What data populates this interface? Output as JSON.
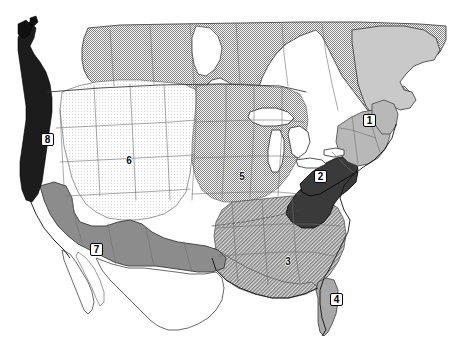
{
  "figure": {
    "width": 458,
    "height": 356,
    "background_color": "#ffffff"
  },
  "map": {
    "projection_note": "North America - continental United States, southern Canada, northern Mexico",
    "outline_color": "#1a1a1a",
    "border_color": "#555555",
    "regions": [
      {
        "id": "region-1",
        "number": "1",
        "area_name": "northeast-new-england",
        "fill_color": "#b8b8b8",
        "pattern": "solid-gray",
        "label_style": "boxed",
        "label_x": 363,
        "label_y": 114
      },
      {
        "id": "region-2",
        "number": "2",
        "area_name": "appalachian-mid-atlantic",
        "fill_color": "#3a3a3a",
        "pattern": "solid-dark",
        "label_style": "boxed",
        "label_x": 314,
        "label_y": 170
      },
      {
        "id": "region-3",
        "number": "3",
        "area_name": "southeast",
        "fill_color": "#c6c6c6",
        "pattern": "diagonal-hatch-light",
        "label_style": "plain",
        "label_x": 282,
        "label_y": 256
      },
      {
        "id": "region-4",
        "number": "4",
        "area_name": "florida-peninsula",
        "fill_color": "#a8a8a8",
        "pattern": "solid-gray",
        "label_style": "boxed",
        "label_x": 330,
        "label_y": 293
      },
      {
        "id": "region-5",
        "number": "5",
        "area_name": "upper-midwest",
        "fill_color": "#d8d8d8",
        "pattern": "fine-stipple",
        "label_style": "plain",
        "label_x": 236,
        "label_y": 171
      },
      {
        "id": "region-6",
        "number": "6",
        "area_name": "intermountain-west",
        "fill_color": "#f2f2f2",
        "pattern": "near-white",
        "label_style": "plain",
        "label_x": 123,
        "label_y": 155
      },
      {
        "id": "region-7",
        "number": "7",
        "area_name": "southwest-borderlands",
        "fill_color": "#8c8c8c",
        "pattern": "solid-medium-dark",
        "label_style": "boxed",
        "label_x": 90,
        "label_y": 243
      },
      {
        "id": "region-8",
        "number": "8",
        "area_name": "pacific-northwest-coast",
        "fill_color": "#1c1c1c",
        "pattern": "solid-black",
        "label_style": "boxed",
        "label_x": 41,
        "label_y": 133
      }
    ],
    "unlabeled_areas": [
      {
        "area_name": "canada",
        "fill_color": "#d0d0d0",
        "pattern": "fine-stipple"
      },
      {
        "area_name": "mexico",
        "fill_color": "#ffffff",
        "pattern": "outline-only"
      },
      {
        "area_name": "great-lakes-water",
        "fill_color": "#ffffff",
        "pattern": "water-white"
      },
      {
        "area_name": "ocean",
        "fill_color": "#ffffff",
        "pattern": "water-white"
      }
    ]
  }
}
